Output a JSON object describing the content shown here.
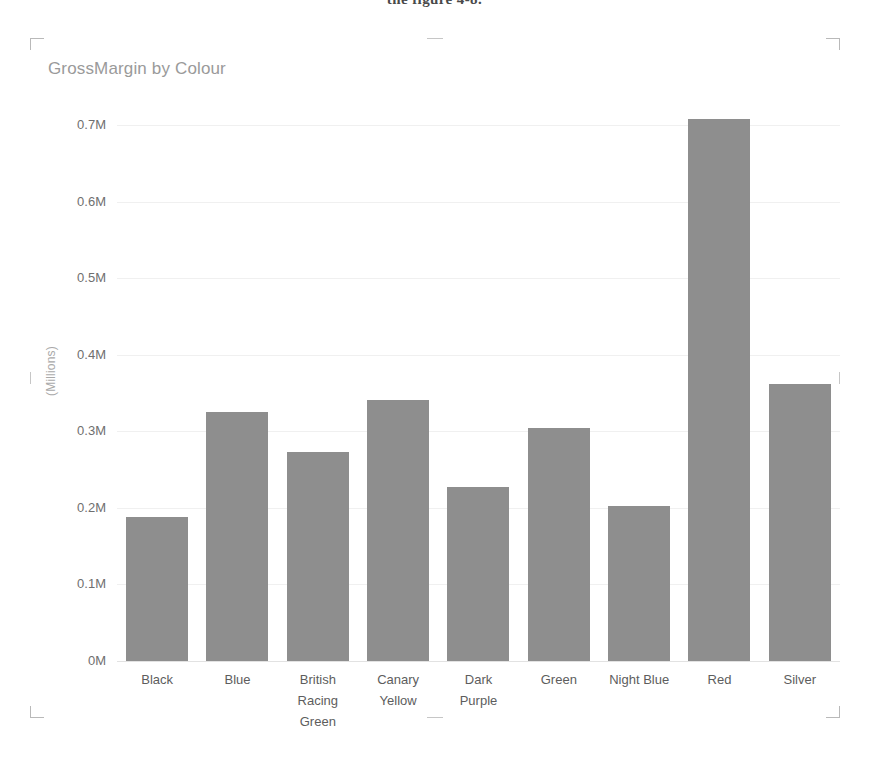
{
  "document": {
    "top_fragment": "the figure 4-8."
  },
  "chart": {
    "title": "GrossMargin by Colour",
    "y_axis_title": "(Millions)"
  },
  "colors": {
    "bar_fill": "#8e8e8e",
    "gridline": "#f0f0f0",
    "title_text": "#9a9a9a",
    "tick_text": "#5d5d5d"
  },
  "chart_data": {
    "type": "bar",
    "title": "GrossMargin by Colour",
    "xlabel": "",
    "ylabel": "(Millions)",
    "categories": [
      "Black",
      "Blue",
      "British Racing Green",
      "Canary Yellow",
      "Dark Purple",
      "Green",
      "Night Blue",
      "Red",
      "Silver"
    ],
    "category_lines": [
      [
        "Black"
      ],
      [
        "Blue"
      ],
      [
        "British",
        "Racing",
        "Green"
      ],
      [
        "Canary",
        "Yellow"
      ],
      [
        "Dark",
        "Purple"
      ],
      [
        "Green"
      ],
      [
        "Night Blue"
      ],
      [
        "Red"
      ],
      [
        "Silver"
      ]
    ],
    "values": [
      0.188,
      0.325,
      0.273,
      0.341,
      0.227,
      0.304,
      0.202,
      0.708,
      0.362
    ],
    "value_unit": "millions",
    "ylim": [
      0,
      0.72
    ],
    "ytick_labels": [
      "0.7M",
      "0.6M",
      "0.5M",
      "0.4M",
      "0.3M",
      "0.2M",
      "0.1M",
      "0M"
    ],
    "ytick_values": [
      0.7,
      0.6,
      0.5,
      0.4,
      0.3,
      0.2,
      0.1,
      0
    ],
    "grid": true,
    "legend": "none",
    "orientation": "vertical"
  }
}
